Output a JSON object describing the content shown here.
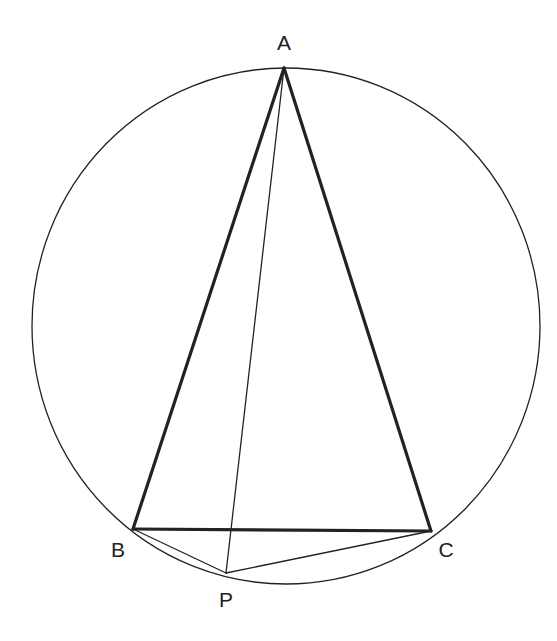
{
  "diagram": {
    "colors": {
      "background": "#ffffff",
      "stroke": "#222222"
    },
    "circle": {
      "cx": 286,
      "cy": 326,
      "rx": 254,
      "ry": 258
    },
    "points": {
      "A": {
        "label": "A",
        "x": 284,
        "y": 68,
        "lx": 284,
        "ly": 50
      },
      "B": {
        "label": "B",
        "x": 133,
        "y": 529,
        "lx": 118,
        "ly": 557
      },
      "C": {
        "label": "C",
        "x": 431,
        "y": 531,
        "lx": 446,
        "ly": 557
      },
      "P": {
        "label": "P",
        "x": 226,
        "y": 573,
        "lx": 226,
        "ly": 607
      }
    },
    "segments": [
      {
        "id": "AB",
        "from": "A",
        "to": "B",
        "weight": "thick"
      },
      {
        "id": "AC",
        "from": "A",
        "to": "C",
        "weight": "thick"
      },
      {
        "id": "BC",
        "from": "B",
        "to": "C",
        "weight": "thick"
      },
      {
        "id": "AP",
        "from": "A",
        "to": "P",
        "weight": "thin"
      },
      {
        "id": "BP",
        "from": "B",
        "to": "P",
        "weight": "thin"
      },
      {
        "id": "CP",
        "from": "C",
        "to": "P",
        "weight": "thin"
      }
    ]
  }
}
